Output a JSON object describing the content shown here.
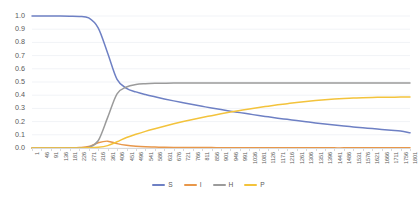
{
  "chart_data": {
    "type": "line",
    "title": "",
    "xlabel": "",
    "ylabel": "",
    "grid": "horizontal",
    "legend_position": "bottom",
    "xlim": [
      1,
      1801
    ],
    "ylim": [
      0.0,
      1.0
    ],
    "x_tick_step": 45,
    "y_tick_labels": [
      "1.0",
      "0.9",
      "0.8",
      "0.7",
      "0.6",
      "0.5",
      "0.4",
      "0.3",
      "0.2",
      "0.1",
      "0.0"
    ],
    "y_tick_values": [
      1.0,
      0.9,
      0.8,
      0.7,
      0.6,
      0.5,
      0.4,
      0.3,
      0.2,
      0.1,
      0.0
    ],
    "x_tick_labels": [
      "1",
      "46",
      "91",
      "136",
      "181",
      "226",
      "271",
      "316",
      "361",
      "406",
      "451",
      "496",
      "541",
      "586",
      "631",
      "676",
      "721",
      "766",
      "811",
      "856",
      "901",
      "946",
      "991",
      "1036",
      "1081",
      "1126",
      "1171",
      "1216",
      "1261",
      "1306",
      "1351",
      "1396",
      "1441",
      "1486",
      "1531",
      "1576",
      "1621",
      "1666",
      "1711",
      "1756",
      "1801"
    ],
    "x": [
      1,
      46,
      91,
      136,
      181,
      226,
      271,
      316,
      361,
      406,
      451,
      496,
      541,
      586,
      631,
      676,
      721,
      766,
      811,
      856,
      901,
      946,
      991,
      1036,
      1081,
      1126,
      1171,
      1216,
      1261,
      1306,
      1351,
      1396,
      1441,
      1486,
      1531,
      1576,
      1621,
      1666,
      1711,
      1756,
      1801
    ],
    "series": [
      {
        "name": "S",
        "color": "#6E80C4",
        "values": [
          1.0,
          1.0,
          1.0,
          1.0,
          0.999,
          0.997,
          0.985,
          0.91,
          0.72,
          0.52,
          0.452,
          0.425,
          0.405,
          0.388,
          0.372,
          0.357,
          0.343,
          0.329,
          0.316,
          0.303,
          0.291,
          0.279,
          0.268,
          0.257,
          0.246,
          0.236,
          0.226,
          0.217,
          0.208,
          0.199,
          0.19,
          0.182,
          0.175,
          0.167,
          0.16,
          0.153,
          0.147,
          0.14,
          0.134,
          0.129,
          0.115
        ]
      },
      {
        "name": "I",
        "color": "#E8974A",
        "values": [
          0.0,
          0.0,
          0.0,
          0.0,
          0.001,
          0.003,
          0.011,
          0.04,
          0.052,
          0.033,
          0.02,
          0.013,
          0.009,
          0.007,
          0.005,
          0.004,
          0.004,
          0.003,
          0.003,
          0.003,
          0.002,
          0.002,
          0.002,
          0.002,
          0.002,
          0.002,
          0.002,
          0.002,
          0.002,
          0.002,
          0.002,
          0.002,
          0.001,
          0.001,
          0.001,
          0.001,
          0.001,
          0.001,
          0.001,
          0.001,
          0.001
        ]
      },
      {
        "name": "H",
        "color": "#9B9B9B",
        "values": [
          0.0,
          0.0,
          0.0,
          0.0,
          0.0,
          0.001,
          0.006,
          0.055,
          0.23,
          0.41,
          0.462,
          0.481,
          0.487,
          0.49,
          0.491,
          0.492,
          0.492,
          0.492,
          0.492,
          0.492,
          0.492,
          0.492,
          0.492,
          0.492,
          0.492,
          0.492,
          0.492,
          0.492,
          0.492,
          0.492,
          0.492,
          0.492,
          0.492,
          0.492,
          0.492,
          0.492,
          0.492,
          0.492,
          0.492,
          0.492,
          0.492
        ]
      },
      {
        "name": "P",
        "color": "#F3C33C",
        "values": [
          0.0,
          0.0,
          0.0,
          0.0,
          0.0,
          0.0,
          0.001,
          0.005,
          0.018,
          0.047,
          0.08,
          0.104,
          0.126,
          0.146,
          0.165,
          0.183,
          0.2,
          0.216,
          0.231,
          0.245,
          0.259,
          0.272,
          0.284,
          0.296,
          0.307,
          0.317,
          0.327,
          0.336,
          0.345,
          0.353,
          0.36,
          0.366,
          0.371,
          0.375,
          0.378,
          0.381,
          0.383,
          0.384,
          0.385,
          0.386,
          0.386
        ]
      }
    ]
  },
  "legend": {
    "items": [
      {
        "label": "S",
        "color": "#6E80C4"
      },
      {
        "label": "I",
        "color": "#E8974A"
      },
      {
        "label": "H",
        "color": "#9B9B9B"
      },
      {
        "label": "P",
        "color": "#F3C33C"
      }
    ]
  },
  "style": {
    "gridline_color": "#F1F3F7",
    "axis_color": "#D9D9D9",
    "tick_text_color": "#595959",
    "background": "#FFFFFF"
  }
}
